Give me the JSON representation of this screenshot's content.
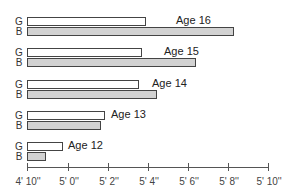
{
  "chart_data": {
    "type": "bar",
    "orientation": "horizontal",
    "title": "",
    "xlabel": "",
    "ylabel": "",
    "categories": [
      "Age 16",
      "Age 15",
      "Age 14",
      "Age 13",
      "Age 12"
    ],
    "series": [
      {
        "name": "G",
        "color": "#ffffff",
        "values_inches": [
          64.0,
          63.8,
          63.6,
          61.9,
          60.0
        ]
      },
      {
        "name": "B",
        "color": "#d2d2d2",
        "values_inches": [
          68.3,
          66.5,
          64.5,
          61.7,
          59.0
        ]
      }
    ],
    "x_axis": {
      "min_inches": 58,
      "max_inches": 70,
      "ticks": [
        "4' 10''",
        "5' 0''",
        "5' 2''",
        "5' 4''",
        "5' 6''",
        "5' 8''",
        "5' 10''"
      ],
      "tick_values_inches": [
        58,
        60,
        62,
        64,
        66,
        68,
        70
      ]
    },
    "grid": false,
    "legend": "inline row labels G / B"
  },
  "groups": [
    {
      "age_label": "Age 16",
      "g_label": "G",
      "b_label": "B",
      "g_end": 146,
      "b_end": 234,
      "label_x": 176,
      "top": 17
    },
    {
      "age_label": "Age 15",
      "g_label": "G",
      "b_label": "B",
      "g_end": 142,
      "b_end": 196,
      "label_x": 164,
      "top": 48
    },
    {
      "age_label": "Age 14",
      "g_label": "G",
      "b_label": "B",
      "g_end": 139,
      "b_end": 157,
      "label_x": 152,
      "top": 80
    },
    {
      "age_label": "Age 13",
      "g_label": "G",
      "b_label": "B",
      "g_end": 105,
      "b_end": 101,
      "label_x": 111,
      "top": 111
    },
    {
      "age_label": "Age 12",
      "g_label": "G",
      "b_label": "B",
      "g_end": 63,
      "b_end": 46,
      "label_x": 68,
      "top": 142
    }
  ],
  "ticks": [
    {
      "label": "4' 10''",
      "x": 27
    },
    {
      "label": "5' 0''",
      "x": 68
    },
    {
      "label": "5' 2''",
      "x": 108
    },
    {
      "label": "5' 4''",
      "x": 148
    },
    {
      "label": "5' 6''",
      "x": 188
    },
    {
      "label": "5' 8''",
      "x": 228
    },
    {
      "label": "5' 10''",
      "x": 268
    }
  ]
}
